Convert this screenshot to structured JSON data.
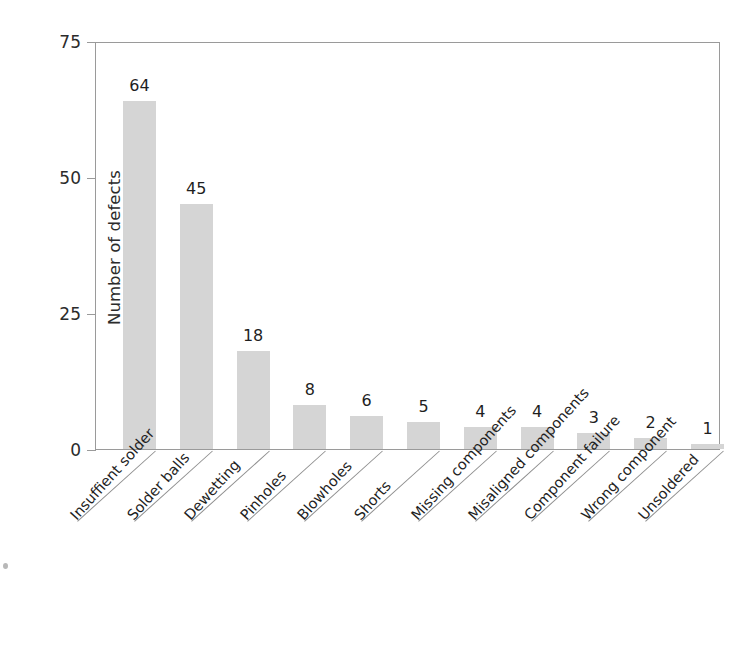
{
  "chart_data": {
    "type": "bar",
    "title": "",
    "subtitle": "",
    "xlabel": "",
    "ylabel": "Number of defects",
    "ylim": [
      0,
      75
    ],
    "yticks": [
      0,
      25,
      50,
      75
    ],
    "ytick_labels": [
      "0",
      "25",
      "50",
      "75"
    ],
    "grid": false,
    "legend": null,
    "bar_color": "#d5d5d5",
    "axis_color": "#9a9a9a",
    "text_color": "#1f1f1f",
    "value_labels_shown": true,
    "categories": [
      "Insuffient solder",
      "Solder balls",
      "Dewetting",
      "Pinholes",
      "Blowholes",
      "Shorts",
      "Missing components",
      "Misaligned components",
      "Component failure",
      "Wrong component",
      "Unsoldered"
    ],
    "values": [
      64,
      45,
      18,
      8,
      6,
      5,
      4,
      4,
      3,
      2,
      1
    ],
    "value_label_texts": [
      "64",
      "45",
      "18",
      "8",
      "6",
      "5",
      "4",
      "4",
      "3",
      "2",
      "1"
    ]
  }
}
